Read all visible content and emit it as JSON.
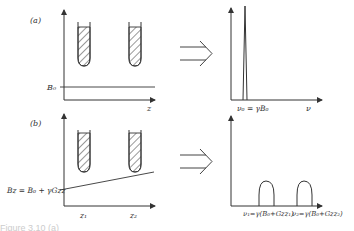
{
  "panel_a": {
    "label": "(a)",
    "left_axis_x_label": "z",
    "left_axis_field_label": "B₀",
    "right_axis_x_label": "ν",
    "right_peak_label": "ν₀ = γB₀"
  },
  "panel_b": {
    "label": "(b)",
    "left_axis_field_label": "Bz = B₀ + γGzz",
    "left_tick_1": "z₁",
    "left_tick_2": "z₂",
    "right_peak_1_label": "ν₁=γ(B₀+Gzz₁)",
    "right_peak_2_label": "ν₂=γ(B₀+Gzz₂)"
  },
  "caption": "Figure 3.10 (a)"
}
